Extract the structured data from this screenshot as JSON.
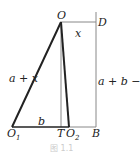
{
  "diagram": {
    "points": {
      "O": "O",
      "D": "D",
      "O1": "O",
      "O1_sub": "1",
      "T": "T",
      "O2": "O",
      "O2_sub": "2",
      "B": "B"
    },
    "segment_labels": {
      "OD": "x",
      "OO1": "a + x",
      "DB": "a + b − x",
      "O1T": "b"
    },
    "caption": "图 1.1",
    "colors": {
      "stroke": "#222222",
      "thin_stroke": "#888888"
    }
  }
}
